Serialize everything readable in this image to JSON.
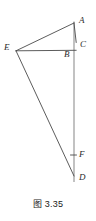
{
  "figure": {
    "caption": "图 3.35",
    "colors": {
      "background": "#ffffff",
      "stroke_dark": "#4a4a4a",
      "stroke_light": "#b3b3b3",
      "label_text": "#2b2b2b",
      "caption_text": "#1a1a1a"
    },
    "labels": {
      "a": "A",
      "b": "B",
      "c": "C",
      "d": "D",
      "e": "E",
      "f": "F"
    },
    "points": {
      "A": {
        "x": 74.0,
        "y": 23.0
      },
      "B": {
        "x": 72.5,
        "y": 51.0
      },
      "C": {
        "x": 76.0,
        "y": 42.0
      },
      "D": {
        "x": 74.0,
        "y": 176.0
      },
      "E": {
        "x": 16.0,
        "y": 50.8
      },
      "F": {
        "x": 74.0,
        "y": 155.0
      }
    },
    "segments": [
      {
        "name": "segment-EA",
        "from": "E",
        "to": "A",
        "tone": "dark"
      },
      {
        "name": "segment-AC",
        "from": "A",
        "to": "C",
        "tone": "dark"
      },
      {
        "name": "segment-EB",
        "from": "E",
        "to": "B",
        "tone": "dark"
      },
      {
        "name": "segment-ED",
        "from": "E",
        "to": "D",
        "tone": "dark"
      },
      {
        "name": "segment-AD-axis",
        "from": "A",
        "to": "D",
        "tone": "light"
      }
    ],
    "tick_marks": [
      {
        "name": "tick-F",
        "x": 74.0,
        "y": 155.0
      }
    ]
  }
}
